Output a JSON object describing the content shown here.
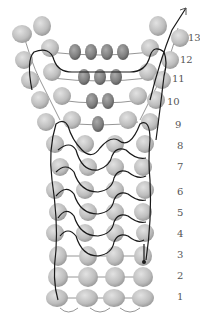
{
  "diagram": {
    "type": "bead-weaving-pattern",
    "colors": {
      "background": "#ffffff",
      "bead_light": "#c4c4c4",
      "bead_light_edge": "#9a9a9a",
      "bead_dark": "#8a8a8a",
      "bead_dark_edge": "#5e5e5e",
      "thread_main": "#1a1a1a",
      "thread_secondary": "#888888"
    },
    "row_labels": [
      {
        "label": "1",
        "x": 177,
        "y": 292
      },
      {
        "label": "2",
        "x": 177,
        "y": 271
      },
      {
        "label": "3",
        "x": 177,
        "y": 250
      },
      {
        "label": "4",
        "x": 177,
        "y": 229
      },
      {
        "label": "5",
        "x": 177,
        "y": 208
      },
      {
        "label": "6",
        "x": 177,
        "y": 187
      },
      {
        "label": "7",
        "x": 177,
        "y": 162
      },
      {
        "label": "8",
        "x": 177,
        "y": 141
      },
      {
        "label": "9",
        "x": 175,
        "y": 120
      },
      {
        "label": "10",
        "x": 167,
        "y": 97
      },
      {
        "label": "11",
        "x": 172,
        "y": 74
      },
      {
        "label": "12",
        "x": 180,
        "y": 55
      },
      {
        "label": "13",
        "x": 190,
        "y": 33
      }
    ],
    "arrow": {
      "direction": "up-right",
      "x": 187,
      "y": 10
    }
  }
}
